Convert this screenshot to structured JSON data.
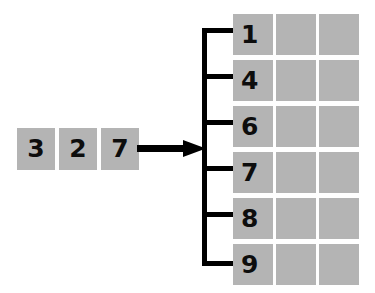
{
  "diagram": {
    "colors": {
      "cell_fill": "#b4b4b4",
      "text": "#0d0d0d",
      "connector": "#000000",
      "background": "#ffffff"
    },
    "input_sequence": {
      "label": "input-keys",
      "items": [
        {
          "value": "3"
        },
        {
          "value": "2"
        },
        {
          "value": "7"
        }
      ]
    },
    "arrow": {
      "name": "insertion-arrow",
      "direction": "right"
    },
    "bracket": {
      "name": "bucket-bracket",
      "branch_count": 6
    },
    "table": {
      "name": "bucket-table",
      "column_count": 3,
      "row_count": 6,
      "rows": [
        {
          "key": "1",
          "cells": [
            "1",
            "",
            ""
          ]
        },
        {
          "key": "4",
          "cells": [
            "4",
            "",
            ""
          ]
        },
        {
          "key": "6",
          "cells": [
            "6",
            "",
            ""
          ]
        },
        {
          "key": "7",
          "cells": [
            "7",
            "",
            ""
          ]
        },
        {
          "key": "8",
          "cells": [
            "8",
            "",
            ""
          ]
        },
        {
          "key": "9",
          "cells": [
            "9",
            "",
            ""
          ]
        }
      ]
    }
  }
}
